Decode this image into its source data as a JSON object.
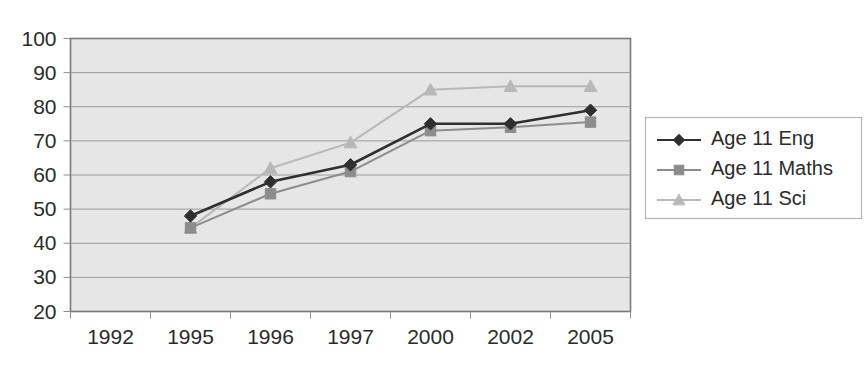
{
  "chart_data": {
    "type": "line",
    "title": "",
    "xlabel": "",
    "ylabel": "",
    "categories": [
      "1992",
      "1995",
      "1996",
      "1997",
      "2000",
      "2002",
      "2005"
    ],
    "ylim": [
      20,
      100
    ],
    "yticks": [
      20,
      30,
      40,
      50,
      60,
      70,
      80,
      90,
      100
    ],
    "grid": true,
    "legend_position": "right",
    "series": [
      {
        "name": "Age 11 Eng",
        "color": "#2f2f2f",
        "marker": "diamond",
        "values": [
          null,
          48,
          58,
          63,
          75,
          75,
          79
        ]
      },
      {
        "name": "Age 11 Maths",
        "color": "#8c8c8c",
        "marker": "square",
        "values": [
          null,
          44.5,
          54.5,
          61,
          73,
          74,
          75.5
        ]
      },
      {
        "name": "Age 11 Sci",
        "color": "#b8b8b8",
        "marker": "triangle",
        "values": [
          null,
          44.5,
          62,
          69.5,
          85,
          86,
          86
        ]
      }
    ]
  },
  "legend": {
    "items": [
      {
        "label": "Age 11 Eng"
      },
      {
        "label": "Age 11 Maths"
      },
      {
        "label": "Age 11 Sci"
      }
    ]
  },
  "colors": {
    "plot_background": "#e6e6e6",
    "plot_border": "#7a7a7a",
    "gridline": "#9a9a9a",
    "text": "#2b2b2b",
    "series_eng": "#2f2f2f",
    "series_maths": "#8c8c8c",
    "series_sci": "#b8b8b8"
  }
}
